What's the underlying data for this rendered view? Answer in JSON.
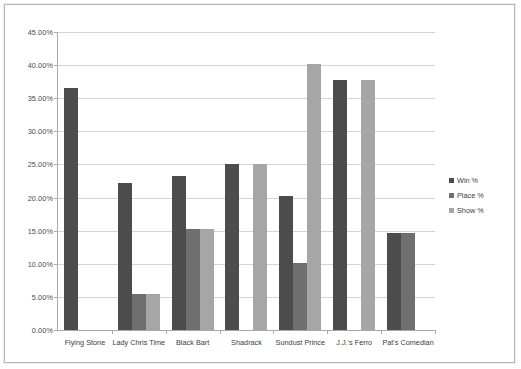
{
  "chart_data": {
    "type": "bar",
    "title": "",
    "subtitle": "",
    "xlabel": "",
    "ylabel": "",
    "ylim": [
      0,
      45
    ],
    "ytick_labels": [
      "0.00%",
      "5.00%",
      "10.00%",
      "15.00%",
      "20.00%",
      "25.00%",
      "30.00%",
      "35.00%",
      "40.00%",
      "45.00%"
    ],
    "ytick_values": [
      0,
      5,
      10,
      15,
      20,
      25,
      30,
      35,
      40,
      45
    ],
    "grid": true,
    "legend_position": "right",
    "categories": [
      "Flying Stone",
      "Lady Chris Time",
      "Black Bart",
      "Shadrack",
      "Sundust Prince",
      "J.J.'s Ferro",
      "Pat's Comedian"
    ],
    "series": [
      {
        "name": "Win %",
        "color": "#4c4c4c",
        "values": [
          36.5,
          22.2,
          23.2,
          25.0,
          20.3,
          37.8,
          14.6
        ]
      },
      {
        "name": "Place %",
        "color": "#6f6f6f",
        "values": [
          0,
          5.5,
          15.3,
          0,
          10.1,
          0,
          14.6
        ]
      },
      {
        "name": "Show %",
        "color": "#a6a6a6",
        "values": [
          0,
          5.5,
          15.3,
          25.0,
          40.2,
          37.8,
          0
        ]
      }
    ]
  },
  "legend": {
    "items": [
      {
        "label": "Win %",
        "swatch": "win"
      },
      {
        "label": "Place %",
        "swatch": "place"
      },
      {
        "label": "Show %",
        "swatch": "show"
      }
    ]
  }
}
